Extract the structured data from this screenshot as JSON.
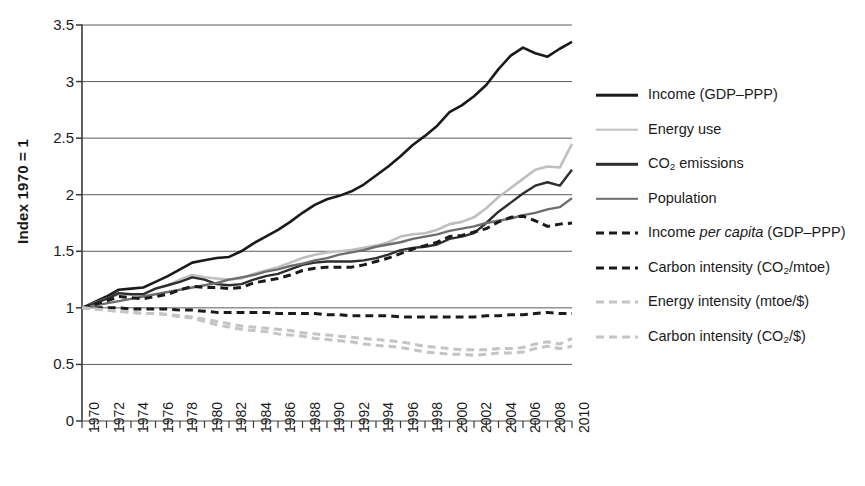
{
  "chart_data": {
    "type": "line",
    "title": "",
    "xlabel": "",
    "ylabel": "Index 1970 = 1",
    "xlim": [
      1970,
      2010
    ],
    "ylim": [
      0,
      3.5
    ],
    "y_ticks": [
      "3.5",
      "3",
      "2.5",
      "2",
      "1.5",
      "1",
      "0.5",
      "0"
    ],
    "y_tick_values": [
      3.5,
      3,
      2.5,
      2,
      1.5,
      1,
      0.5,
      0
    ],
    "x_ticks": [
      "1970",
      "1972",
      "1974",
      "1976",
      "1978",
      "1980",
      "1982",
      "1984",
      "1986",
      "1988",
      "1990",
      "1992",
      "1994",
      "1996",
      "1998",
      "2000",
      "2002",
      "2004",
      "2006",
      "2008",
      "2010"
    ],
    "x_minor_tick_step": 1,
    "grid": "horizontal",
    "legend_position": "right",
    "x": [
      1970,
      1971,
      1972,
      1973,
      1974,
      1975,
      1976,
      1977,
      1978,
      1979,
      1980,
      1981,
      1982,
      1983,
      1984,
      1985,
      1986,
      1987,
      1988,
      1989,
      1990,
      1991,
      1992,
      1993,
      1994,
      1995,
      1996,
      1997,
      1998,
      1999,
      2000,
      2001,
      2002,
      2003,
      2004,
      2005,
      2006,
      2007,
      2008,
      2009,
      2010
    ],
    "series": [
      {
        "name": "Income (GDP–PPP)",
        "style": "solid",
        "color": "#1a1a1a",
        "width": 2.6,
        "values": [
          1.0,
          1.05,
          1.1,
          1.16,
          1.17,
          1.18,
          1.23,
          1.28,
          1.34,
          1.4,
          1.42,
          1.44,
          1.45,
          1.5,
          1.57,
          1.63,
          1.69,
          1.76,
          1.84,
          1.91,
          1.96,
          1.99,
          2.03,
          2.09,
          2.17,
          2.25,
          2.34,
          2.44,
          2.52,
          2.61,
          2.73,
          2.79,
          2.87,
          2.97,
          3.11,
          3.23,
          3.3,
          3.25,
          3.22,
          3.29,
          3.35
        ]
      },
      {
        "name": "Energy use",
        "style": "solid",
        "color": "#bfbfbf",
        "width": 2.6,
        "values": [
          1.0,
          1.04,
          1.08,
          1.12,
          1.12,
          1.12,
          1.17,
          1.2,
          1.25,
          1.29,
          1.27,
          1.26,
          1.25,
          1.26,
          1.3,
          1.33,
          1.36,
          1.4,
          1.44,
          1.47,
          1.49,
          1.5,
          1.51,
          1.53,
          1.55,
          1.58,
          1.63,
          1.65,
          1.66,
          1.69,
          1.74,
          1.76,
          1.8,
          1.88,
          1.98,
          2.06,
          2.14,
          2.22,
          2.25,
          2.24,
          2.45
        ]
      },
      {
        "name": "CO2 emissions",
        "style": "solid",
        "color": "#2e2e2e",
        "width": 2.4,
        "values": [
          1.0,
          1.04,
          1.08,
          1.13,
          1.12,
          1.12,
          1.17,
          1.2,
          1.23,
          1.27,
          1.25,
          1.21,
          1.2,
          1.21,
          1.25,
          1.28,
          1.3,
          1.34,
          1.38,
          1.4,
          1.41,
          1.41,
          1.41,
          1.42,
          1.44,
          1.47,
          1.51,
          1.53,
          1.54,
          1.56,
          1.61,
          1.63,
          1.66,
          1.75,
          1.85,
          1.93,
          2.01,
          2.08,
          2.11,
          2.08,
          2.22
        ]
      },
      {
        "name": "Population",
        "style": "solid",
        "color": "#6e6e6e",
        "width": 2.4,
        "values": [
          1.0,
          1.02,
          1.04,
          1.06,
          1.08,
          1.1,
          1.12,
          1.14,
          1.16,
          1.18,
          1.2,
          1.22,
          1.25,
          1.27,
          1.29,
          1.32,
          1.34,
          1.37,
          1.39,
          1.42,
          1.44,
          1.47,
          1.49,
          1.51,
          1.54,
          1.56,
          1.58,
          1.61,
          1.63,
          1.65,
          1.68,
          1.7,
          1.72,
          1.75,
          1.77,
          1.79,
          1.82,
          1.84,
          1.87,
          1.89,
          1.97
        ]
      },
      {
        "name": "Income per capita (GDP–PPP)",
        "style": "dashed",
        "color": "#1a1a1a",
        "width": 3.0,
        "values": [
          1.0,
          1.03,
          1.06,
          1.1,
          1.09,
          1.08,
          1.1,
          1.12,
          1.16,
          1.19,
          1.18,
          1.18,
          1.17,
          1.18,
          1.22,
          1.24,
          1.26,
          1.29,
          1.33,
          1.35,
          1.36,
          1.36,
          1.36,
          1.38,
          1.41,
          1.44,
          1.48,
          1.52,
          1.55,
          1.58,
          1.63,
          1.64,
          1.67,
          1.7,
          1.76,
          1.8,
          1.81,
          1.77,
          1.72,
          1.74,
          1.75
        ]
      },
      {
        "name": "Carbon intensity (CO2/mtoe)",
        "style": "dashed",
        "color": "#1a1a1a",
        "width": 3.0,
        "values": [
          1.0,
          1.0,
          1.0,
          1.0,
          0.99,
          0.99,
          0.99,
          0.99,
          0.98,
          0.98,
          0.97,
          0.96,
          0.96,
          0.96,
          0.96,
          0.96,
          0.95,
          0.95,
          0.95,
          0.95,
          0.94,
          0.94,
          0.93,
          0.93,
          0.93,
          0.93,
          0.92,
          0.92,
          0.92,
          0.92,
          0.92,
          0.92,
          0.92,
          0.93,
          0.93,
          0.94,
          0.94,
          0.95,
          0.96,
          0.95,
          0.95
        ]
      },
      {
        "name": "Energy intensity (mtoe/$)",
        "style": "dashed",
        "color": "#c4c4c4",
        "width": 3.0,
        "values": [
          1.0,
          0.99,
          0.98,
          0.97,
          0.96,
          0.95,
          0.95,
          0.94,
          0.93,
          0.92,
          0.9,
          0.88,
          0.86,
          0.84,
          0.83,
          0.82,
          0.81,
          0.8,
          0.78,
          0.77,
          0.76,
          0.75,
          0.74,
          0.73,
          0.72,
          0.71,
          0.7,
          0.68,
          0.66,
          0.65,
          0.64,
          0.63,
          0.63,
          0.63,
          0.64,
          0.64,
          0.65,
          0.68,
          0.7,
          0.68,
          0.73
        ]
      },
      {
        "name": "Carbon intensity (CO2/$)",
        "style": "dashed",
        "color": "#c4c4c4",
        "width": 3.0,
        "values": [
          1.0,
          0.99,
          0.98,
          0.97,
          0.96,
          0.95,
          0.95,
          0.94,
          0.92,
          0.91,
          0.88,
          0.85,
          0.83,
          0.81,
          0.8,
          0.79,
          0.77,
          0.76,
          0.75,
          0.73,
          0.72,
          0.71,
          0.7,
          0.68,
          0.67,
          0.66,
          0.65,
          0.63,
          0.61,
          0.6,
          0.59,
          0.59,
          0.58,
          0.59,
          0.6,
          0.6,
          0.61,
          0.64,
          0.66,
          0.64,
          0.66
        ]
      }
    ]
  },
  "axis": {
    "y_title": "Index 1970 = 1"
  },
  "legend": {
    "items": [
      {
        "label_html": "Income (GDP–PPP)",
        "style": "solid",
        "color": "#1a1a1a",
        "width": 2.6
      },
      {
        "label_html": "Energy use",
        "style": "solid",
        "color": "#bfbfbf",
        "width": 2.6
      },
      {
        "label_html": "CO<sub>2</sub> emissions",
        "style": "solid",
        "color": "#2e2e2e",
        "width": 2.4
      },
      {
        "label_html": "Population",
        "style": "solid",
        "color": "#6e6e6e",
        "width": 2.4
      },
      {
        "label_html": "Income <span class=\"it\">per capita</span> (GDP–PPP)",
        "style": "dashed",
        "color": "#1a1a1a",
        "width": 3.0
      },
      {
        "label_html": "Carbon intensity (CO<sub>2</sub>/mtoe)",
        "style": "dashed",
        "color": "#1a1a1a",
        "width": 3.0
      },
      {
        "label_html": "Energy intensity (mtoe/$)",
        "style": "dashed",
        "color": "#c4c4c4",
        "width": 3.0
      },
      {
        "label_html": "Carbon intensity (CO<sub>2</sub>/$)",
        "style": "dashed",
        "color": "#c4c4c4",
        "width": 3.0
      }
    ]
  },
  "colors": {
    "axis": "#3a3a3a",
    "grid": "#4a4a4a",
    "background": "#ffffff"
  }
}
